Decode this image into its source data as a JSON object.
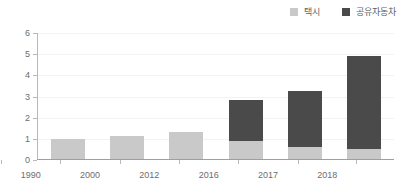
{
  "chart_data": {
    "type": "bar",
    "stacked": true,
    "title": "",
    "subtitle": "",
    "xlabel": "",
    "ylabel": "",
    "categories": [
      "1990",
      "2000",
      "2012",
      "2016",
      "2017",
      "2018"
    ],
    "series": [
      {
        "name": "택시",
        "color": "#c9c9c9",
        "values": [
          0.95,
          1.1,
          1.3,
          0.88,
          0.55,
          0.5
        ]
      },
      {
        "name": "공유자동차",
        "color": "#4a4a4a",
        "values": [
          0,
          0,
          0,
          1.95,
          2.7,
          4.4
        ]
      }
    ],
    "totals": [
      0.95,
      1.1,
      1.3,
      2.83,
      3.25,
      4.9
    ],
    "ylim": [
      0,
      6
    ],
    "yticks": [
      "0",
      "1",
      "2",
      "3",
      "4",
      "5",
      "6"
    ],
    "ytick_values": [
      0,
      1,
      2,
      3,
      4,
      5,
      6
    ],
    "grid": true,
    "legend_position": "top-right"
  },
  "legend": {
    "items": [
      {
        "label": "택시",
        "color": "#c9c9c9"
      },
      {
        "label": "공유자동차",
        "color": "#4a4a4a"
      }
    ]
  },
  "axis": {
    "y_labels": [
      "6",
      "5",
      "4",
      "3",
      "2",
      "1",
      "0"
    ],
    "x_labels": [
      "1990",
      "2000",
      "2012",
      "2016",
      "2017",
      "2018"
    ]
  },
  "colors": {
    "taxi": "#c9c9c9",
    "shared_car": "#4a4a4a",
    "axis": "#b8b8b8",
    "grid": "#f2f2f2",
    "text": "#6d6d6d",
    "background": "#ffffff"
  }
}
